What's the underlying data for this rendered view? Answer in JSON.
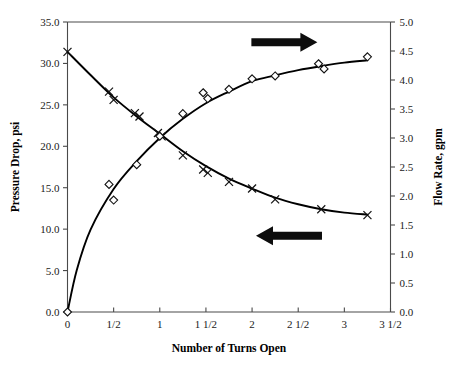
{
  "chart_data": {
    "type": "scatter",
    "title": "",
    "xlabel": "Number of Turns Open",
    "ylabel": "Pressure Drop, psi",
    "y2label": "Flow Rate, gpm",
    "xlim": [
      0,
      3.5
    ],
    "ylim": [
      0,
      35
    ],
    "y2lim": [
      0,
      5
    ],
    "grid": false,
    "legend_position": "none",
    "x_ticks": [
      0,
      0.5,
      1,
      1.5,
      2,
      2.5,
      3,
      3.5
    ],
    "x_tick_labels": [
      "0",
      "1/2",
      "1",
      "1 1/2",
      "2",
      "2 1/2",
      "3",
      "3 1/2"
    ],
    "y_ticks": [
      0,
      5,
      10,
      15,
      20,
      25,
      30,
      35
    ],
    "y_tick_labels": [
      "0.0",
      "5.0",
      "10.0",
      "15.0",
      "20.0",
      "25.0",
      "30.0",
      "35.0"
    ],
    "y2_ticks": [
      0,
      0.5,
      1,
      1.5,
      2,
      2.5,
      3,
      3.5,
      4,
      4.5,
      5
    ],
    "y2_tick_labels": [
      "0.0",
      "0.5",
      "1.0",
      "1.5",
      "2.0",
      "2.5",
      "3.0",
      "3.5",
      "4.0",
      "4.5",
      "5.0"
    ],
    "series": [
      {
        "name": "Pressure Drop, psi",
        "axis": "left",
        "marker": "x",
        "points": [
          [
            0.0,
            31.4
          ],
          [
            0.45,
            26.6
          ],
          [
            0.5,
            25.6
          ],
          [
            0.73,
            24.0
          ],
          [
            0.78,
            23.6
          ],
          [
            0.98,
            21.6
          ],
          [
            1.02,
            21.2
          ],
          [
            1.25,
            18.9
          ],
          [
            1.47,
            17.2
          ],
          [
            1.52,
            16.8
          ],
          [
            1.75,
            15.7
          ],
          [
            2.0,
            14.9
          ],
          [
            2.25,
            13.6
          ],
          [
            2.75,
            12.4
          ],
          [
            3.25,
            11.7
          ]
        ],
        "fit_curve": [
          [
            0.0,
            31.4
          ],
          [
            0.25,
            28.6
          ],
          [
            0.5,
            25.9
          ],
          [
            0.75,
            23.6
          ],
          [
            1.0,
            21.5
          ],
          [
            1.25,
            19.4
          ],
          [
            1.5,
            17.6
          ],
          [
            1.75,
            16.1
          ],
          [
            2.0,
            14.9
          ],
          [
            2.25,
            13.8
          ],
          [
            2.5,
            13.0
          ],
          [
            2.75,
            12.4
          ],
          [
            3.0,
            12.0
          ],
          [
            3.25,
            11.75
          ]
        ]
      },
      {
        "name": "Flow Rate, gpm",
        "axis": "right",
        "marker": "diamond",
        "points": [
          [
            0.0,
            0.0
          ],
          [
            0.45,
            2.2
          ],
          [
            0.5,
            1.93
          ],
          [
            0.75,
            2.54
          ],
          [
            1.0,
            3.03
          ],
          [
            1.25,
            3.42
          ],
          [
            1.47,
            3.78
          ],
          [
            1.52,
            3.68
          ],
          [
            1.75,
            3.84
          ],
          [
            2.0,
            4.02
          ],
          [
            2.25,
            4.07
          ],
          [
            2.72,
            4.28
          ],
          [
            2.78,
            4.19
          ],
          [
            3.25,
            4.4
          ]
        ],
        "fit_curve": [
          [
            0.0,
            0.0
          ],
          [
            0.1,
            0.72
          ],
          [
            0.25,
            1.42
          ],
          [
            0.5,
            2.12
          ],
          [
            0.75,
            2.6
          ],
          [
            1.0,
            3.0
          ],
          [
            1.25,
            3.33
          ],
          [
            1.5,
            3.6
          ],
          [
            1.75,
            3.8
          ],
          [
            2.0,
            3.98
          ],
          [
            2.25,
            4.08
          ],
          [
            2.5,
            4.17
          ],
          [
            2.75,
            4.24
          ],
          [
            3.0,
            4.3
          ],
          [
            3.25,
            4.34
          ]
        ]
      }
    ],
    "annotations": [
      {
        "name": "flow-rate-arrow",
        "direction": "right",
        "x_data": 2.35,
        "y2_data": 4.65,
        "target_axis": "right"
      },
      {
        "name": "pressure-drop-arrow",
        "direction": "left",
        "x_data": 2.4,
        "y_data": 9.2,
        "target_axis": "left"
      }
    ]
  }
}
